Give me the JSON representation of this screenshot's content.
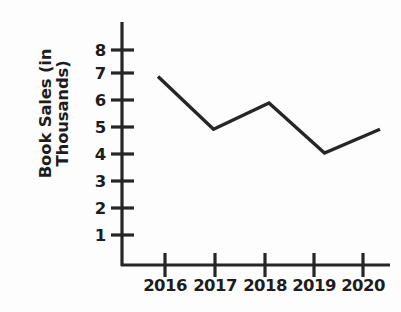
{
  "chart_data": {
    "type": "line",
    "title": "",
    "xlabel": "",
    "ylabel": "Book Sales (in\nThousands)",
    "ylabel_lines": [
      "Book Sales (in",
      "Thousands)"
    ],
    "categories": [
      "2016",
      "2017",
      "2018",
      "2019",
      "2020"
    ],
    "values": [
      7,
      5,
      6,
      4.1,
      5
    ],
    "series": [
      {
        "name": "Book Sales",
        "values": [
          7,
          5,
          6,
          4.1,
          5
        ]
      }
    ],
    "x_tick_labels": [
      "2016",
      "2017",
      "2018",
      "2019",
      "2020"
    ],
    "y_tick_labels": [
      "1",
      "2",
      "3",
      "4",
      "5",
      "6",
      "7",
      "8"
    ],
    "y_tick_values": [
      1,
      2,
      3,
      4,
      5,
      6,
      7,
      8
    ],
    "ylim": [
      0,
      8.6
    ],
    "grid": false,
    "legend": false,
    "legend_position": "none",
    "line_color": "#262626",
    "axis_color": "#262626",
    "background_color": "#fdfdfd",
    "text_color": "#1d1d1d"
  }
}
